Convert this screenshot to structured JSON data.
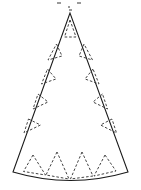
{
  "figure": {
    "title": "Cone net pattern",
    "description": "Unrolled cone (party hat) net: an isosceles triangle with a curved bottom arc, with dashed triangular tab guides along all three edges.",
    "canvas": {
      "width": 141,
      "height": 190
    },
    "colors": {
      "background": "#ffffff",
      "outline_stroke": "#1a1a1a",
      "guide_stroke": "#3a3a3a",
      "fill": "#ffffff",
      "speck": "#9a9a9a"
    },
    "stroke": {
      "outline_width": 1.05,
      "guide_width": 0.95,
      "guide_dasharray": "2.6 1.9"
    },
    "outline": {
      "shape": "triangle-with-arc-base",
      "apex": {
        "x": 70,
        "y": 13
      },
      "bottom_left": {
        "x": 13,
        "y": 172
      },
      "bottom_right": {
        "x": 128,
        "y": 172
      },
      "arc_sagitta": 9,
      "arc_mid": {
        "x": 70.5,
        "y": 181
      },
      "path": "M 70 13 L 13 172 Q 70.5 189 128 172 L 70 13 Z"
    },
    "guides": {
      "apex_triangle": {
        "label": "apex fold tab",
        "path": "M 70 20 L 64.5 37 L 76 37 Z"
      },
      "left_edge_triangles": [
        {
          "label": "left tab 1",
          "path": "M 56.5 44 L 62 56 L 48 60 Z"
        },
        {
          "label": "left tab 2",
          "path": "M 47.5 69 L 56 79 L 41.5 84 Z"
        },
        {
          "label": "left tab 3",
          "path": "M 38 94 L 48 102 L 33 109 Z"
        },
        {
          "label": "left tab 4",
          "path": "M 28.5 119 L 40.5 125 L 24 133 Z"
        }
      ],
      "right_edge_triangles": [
        {
          "label": "right tab 1",
          "path": "M 84 44 L 79 56 L 92.5 60 Z"
        },
        {
          "label": "right tab 2",
          "path": "M 93 69 L 85 79 L 99 84 Z"
        },
        {
          "label": "right tab 3",
          "path": "M 102.5 94 L 93 102 L 107.5 109 Z"
        },
        {
          "label": "right tab 4",
          "path": "M 112 119 L 100.5 125 L 116.5 133 Z"
        }
      ],
      "bottom_arc_triangles": [
        {
          "label": "bottom tab 1",
          "path": "M 33 155 L 23.5 171.5 L 45.5 175 Z"
        },
        {
          "label": "bottom tab 2",
          "path": "M 57 152 L 46 175 L 69 179 Z"
        },
        {
          "label": "bottom tab 3",
          "path": "M 82 152 L 70.5 179 L 93 176 Z"
        },
        {
          "label": "bottom tab 4",
          "path": "M 105 155 L 94 176 L 116 171 Z"
        }
      ]
    },
    "specks": [
      {
        "x": 57,
        "y": 2,
        "w": 4,
        "h": 2
      },
      {
        "x": 77,
        "y": 2,
        "w": 4,
        "h": 2
      },
      {
        "x": 68,
        "y": 6,
        "w": 2,
        "h": 2
      },
      {
        "x": 69,
        "y": 9,
        "w": 3,
        "h": 2
      }
    ]
  },
  "chart_data": {
    "type": "diagram",
    "title": "Cone net pattern",
    "subtitle": "",
    "xlabel": "",
    "ylabel": "",
    "annotations": [],
    "legend": [],
    "elements": [
      {
        "name": "outline",
        "kind": "polygon-with-arc",
        "vertices": 3,
        "dashed": false
      },
      {
        "name": "apex-guide-triangle",
        "kind": "triangle",
        "count": 1,
        "dashed": true
      },
      {
        "name": "left-edge-guide-triangles",
        "kind": "triangle",
        "count": 4,
        "dashed": true
      },
      {
        "name": "right-edge-guide-triangles",
        "kind": "triangle",
        "count": 4,
        "dashed": true
      },
      {
        "name": "bottom-arc-guide-triangles",
        "kind": "triangle",
        "count": 4,
        "dashed": true
      }
    ]
  }
}
